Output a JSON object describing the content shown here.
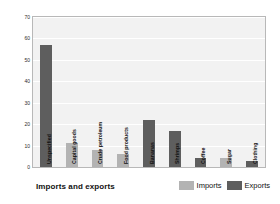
{
  "chart_data": {
    "type": "bar",
    "title": "",
    "xlabel": "Imports and exports",
    "ylabel": "Percentage of total",
    "ylim": [
      0,
      70
    ],
    "yticks": [
      70,
      60,
      50,
      40,
      30,
      20,
      10,
      0
    ],
    "grid": true,
    "legend_position": "bottom-right",
    "categories": [
      "Unspecified",
      "Capital goods",
      "Crude petroleum",
      "Food products",
      "Bananas",
      "Shrimps",
      "Coffee",
      "Sugar",
      "Clothing"
    ],
    "series": [
      {
        "name": "Imports",
        "color": "#b3b3b3",
        "values": [
          null,
          11,
          8,
          6,
          null,
          null,
          null,
          4,
          null
        ]
      },
      {
        "name": "Exports",
        "color": "#5e5e5e",
        "values": [
          57,
          null,
          null,
          null,
          22,
          17,
          4,
          null,
          3
        ]
      }
    ],
    "bars": [
      {
        "category": "Unspecified",
        "series": "Exports",
        "value": 57
      },
      {
        "category": "Capital goods",
        "series": "Imports",
        "value": 11
      },
      {
        "category": "Crude petroleum",
        "series": "Imports",
        "value": 8
      },
      {
        "category": "Food products",
        "series": "Imports",
        "value": 6
      },
      {
        "category": "Bananas",
        "series": "Exports",
        "value": 22
      },
      {
        "category": "Shrimps",
        "series": "Exports",
        "value": 17
      },
      {
        "category": "Coffee",
        "series": "Exports",
        "value": 4
      },
      {
        "category": "Sugar",
        "series": "Imports",
        "value": 4
      },
      {
        "category": "Clothing",
        "series": "Exports",
        "value": 3
      }
    ]
  },
  "legend": {
    "items": [
      {
        "label": "Imports",
        "color": "#b3b3b3"
      },
      {
        "label": "Exports",
        "color": "#5e5e5e"
      }
    ]
  },
  "colors": {
    "imports": "#b3b3b3",
    "exports": "#5e5e5e",
    "plot_background": "#f2f2f2",
    "gridline": "#ffffff",
    "frame": "#b8b8b8"
  }
}
